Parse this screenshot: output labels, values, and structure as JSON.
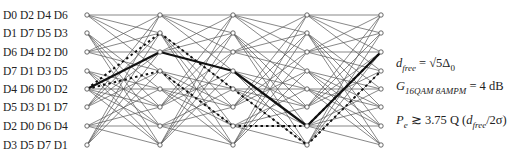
{
  "state_labels": [
    "D0 D2 D4 D6",
    "D1 D7 D5 D3",
    "D6 D4 D2 D0",
    "D7 D1 D3 D5",
    "D4 D6 D0 D2",
    "D5 D3 D1 D7",
    "D2 D0 D6 D4",
    "D3 D5 D7 D1"
  ],
  "trellis": {
    "columns_x": [
      87,
      160,
      233,
      307,
      381
    ],
    "rows_y": [
      15,
      33,
      52,
      71,
      89,
      107,
      126,
      145
    ],
    "bold_path": [
      [
        0,
        4
      ],
      [
        1,
        2
      ],
      [
        2,
        3
      ],
      [
        3,
        6
      ],
      [
        4,
        2
      ]
    ],
    "dashed_paths": [
      [
        [
          0,
          4
        ],
        [
          1,
          1
        ],
        [
          2,
          4
        ],
        [
          3,
          7
        ],
        [
          4,
          3
        ]
      ],
      [
        [
          0,
          4
        ],
        [
          1,
          3
        ],
        [
          2,
          6
        ],
        [
          3,
          6
        ],
        [
          4,
          2
        ]
      ]
    ]
  },
  "equations": {
    "dfree_lhs": "d",
    "dfree_sub": "free",
    "dfree_rhs": " = √5Δ",
    "dfree_rhs_sub": "0",
    "gain_lhs": "G",
    "gain_sub": "16QAM 8AMPM",
    "gain_rhs": " =  4 dB",
    "pe_lhs": "P",
    "pe_sub": "e",
    "pe_rhs": " ≳ 3.75 Q (",
    "pe_d": "d",
    "pe_dsub": "free",
    "pe_tail": "/2σ)"
  }
}
